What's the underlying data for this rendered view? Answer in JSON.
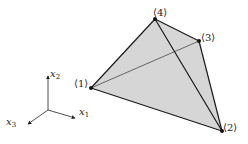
{
  "diagram": {
    "type": "tetrahedron",
    "fill_color": "#d6d6d6",
    "edge_color": "#1a1a1a",
    "vertices": [
      {
        "id": "1",
        "label": "⟨1⟩",
        "x": 91,
        "y": 88
      },
      {
        "id": "2",
        "label": "⟨2⟩",
        "x": 222,
        "y": 131
      },
      {
        "id": "3",
        "label": "⟨3⟩",
        "x": 199,
        "y": 41
      },
      {
        "id": "4",
        "label": "⟨4⟩",
        "x": 155,
        "y": 19
      }
    ],
    "hidden_edge": {
      "from": "1",
      "to": "3"
    },
    "axes": {
      "origin": {
        "x": 48,
        "y": 110
      },
      "x1": {
        "name": "x",
        "sub": "1"
      },
      "x2": {
        "name": "x",
        "sub": "2"
      },
      "x3": {
        "name": "x",
        "sub": "3"
      }
    }
  }
}
